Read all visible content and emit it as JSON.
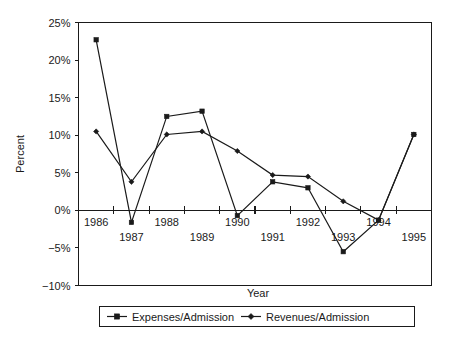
{
  "chart_data": {
    "type": "line",
    "title": "",
    "xlabel": "Year",
    "ylabel": "Percent",
    "grid": false,
    "legend_position": "bottom",
    "categories": [
      "1986",
      "1987",
      "1988",
      "1989",
      "1990",
      "1991",
      "1992",
      "1993",
      "1994",
      "1995"
    ],
    "x": [
      1986,
      1987,
      1988,
      1989,
      1990,
      1991,
      1992,
      1993,
      1994,
      1995
    ],
    "ylim": [
      -10,
      25
    ],
    "yticks": [
      -10,
      -5,
      0,
      5,
      10,
      15,
      20,
      25
    ],
    "ytick_labels": [
      "−10%",
      "−5%",
      "0%",
      "5%",
      "10%",
      "15%",
      "20%",
      "25%"
    ],
    "xtick_labels": [
      "1986",
      "1987",
      "1988",
      "1989",
      "1990",
      "1991",
      "1992",
      "1993",
      "1994",
      "1995"
    ],
    "series": [
      {
        "name": "Expenses/Admission",
        "marker": "square",
        "values": [
          22.7,
          -1.6,
          12.5,
          13.2,
          -0.7,
          3.8,
          3.0,
          -5.5,
          -1.3,
          10.1
        ]
      },
      {
        "name": "Revenues/Admission",
        "marker": "diamond",
        "values": [
          10.5,
          3.8,
          10.1,
          10.5,
          7.9,
          4.7,
          4.5,
          1.2,
          -1.3,
          10.1
        ]
      }
    ],
    "units": "percent",
    "line_color": "#1a1a1a"
  },
  "axes": {
    "y_title": "Percent",
    "x_title": "Year",
    "y_tick_0": "25%",
    "y_tick_1": "20%",
    "y_tick_2": "15%",
    "y_tick_3": "10%",
    "y_tick_4": "5%",
    "y_tick_5": "0%",
    "y_tick_6": "−5%",
    "y_tick_7": "−10%",
    "x_tick_0": "1986",
    "x_tick_1": "1987",
    "x_tick_2": "1988",
    "x_tick_3": "1989",
    "x_tick_4": "1990",
    "x_tick_5": "1991",
    "x_tick_6": "1992",
    "x_tick_7": "1993",
    "x_tick_8": "1994",
    "x_tick_9": "1995"
  },
  "legend": {
    "entries": [
      {
        "label": "Expenses/Admission",
        "marker": "square"
      },
      {
        "label": "Revenues/Admission",
        "marker": "diamond"
      }
    ],
    "entry_0_label": "Expenses/Admission",
    "entry_1_label": "Revenues/Admission"
  },
  "colors": {
    "ink": "#1a1a1a",
    "background": "#ffffff"
  }
}
